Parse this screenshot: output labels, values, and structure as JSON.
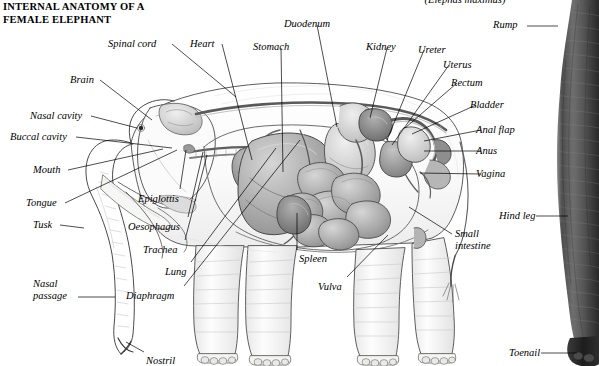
{
  "header": {
    "title": "INTERNAL ANATOMY OF A\nFEMALE ELEPHANT",
    "scientific_name": "(Elephas maximus)"
  },
  "colors": {
    "background": "#ffffff",
    "ink": "#000000",
    "organ_dark": "#6e6e6e",
    "organ_mid": "#9a9a9a",
    "organ_light": "#c9c9c9",
    "body_line": "#4a4a4a",
    "body_fill": "#fbfbfb",
    "photo_dark": "#2b2b2b",
    "photo_mid": "#6a6a6a"
  },
  "figure": {
    "type": "anatomical-illustration",
    "panels": [
      {
        "name": "illustration-panel",
        "description": "pen-and-ink lateral cutaway of a female elephant with internal organs"
      },
      {
        "name": "photo-panel",
        "description": "black-and-white photograph strip of a real elephant hind leg at right edge"
      }
    ]
  },
  "labels": [
    {
      "id": "spinal-cord",
      "text": "Spinal cord",
      "x": 108,
      "y": 38,
      "align": "left",
      "lx": 172,
      "ly": 44,
      "tx": 236,
      "ty": 97
    },
    {
      "id": "heart",
      "text": "Heart",
      "x": 190,
      "y": 38,
      "align": "left",
      "lx": 222,
      "ly": 44,
      "tx": 252,
      "ty": 160
    },
    {
      "id": "stomach",
      "text": "Stomach",
      "x": 253,
      "y": 41,
      "align": "left",
      "lx": 281,
      "ly": 48,
      "tx": 283,
      "ty": 172
    },
    {
      "id": "duodenum",
      "text": "Duodenum",
      "x": 284,
      "y": 18,
      "align": "left",
      "lx": 317,
      "ly": 25,
      "tx": 337,
      "ty": 127
    },
    {
      "id": "kidney",
      "text": "Kidney",
      "x": 366,
      "y": 41,
      "align": "left",
      "lx": 387,
      "ly": 48,
      "tx": 370,
      "ty": 118
    },
    {
      "id": "ureter",
      "text": "Ureter",
      "x": 418,
      "y": 44,
      "align": "left",
      "lx": 424,
      "ly": 50,
      "tx": 387,
      "ty": 140
    },
    {
      "id": "uterus",
      "text": "Uterus",
      "x": 443,
      "y": 59,
      "align": "left",
      "lx": 449,
      "ly": 65,
      "tx": 392,
      "ty": 145
    },
    {
      "id": "rectum",
      "text": "Rectum",
      "x": 451,
      "y": 77,
      "align": "left",
      "lx": 457,
      "ly": 83,
      "tx": 405,
      "ty": 128
    },
    {
      "id": "bladder",
      "text": "Bladder",
      "x": 470,
      "y": 99,
      "align": "left",
      "lx": 476,
      "ly": 105,
      "tx": 412,
      "ty": 134
    },
    {
      "id": "anal-flap",
      "text": "Anal flap",
      "x": 476,
      "y": 124,
      "align": "left",
      "lx": 481,
      "ly": 130,
      "tx": 424,
      "ty": 141
    },
    {
      "id": "anus",
      "text": "Anus",
      "x": 476,
      "y": 145,
      "align": "left",
      "lx": 481,
      "ly": 151,
      "tx": 424,
      "ty": 151
    },
    {
      "id": "vagina",
      "text": "Vagina",
      "x": 476,
      "y": 168,
      "align": "left",
      "lx": 481,
      "ly": 174,
      "tx": 420,
      "ty": 173
    },
    {
      "id": "rump",
      "text": "Rump",
      "x": 493,
      "y": 19,
      "align": "left",
      "lx": 527,
      "ly": 26,
      "tx": 558,
      "ty": 26
    },
    {
      "id": "hind-leg",
      "text": "Hind leg",
      "x": 499,
      "y": 210,
      "align": "left",
      "lx": 536,
      "ly": 216,
      "tx": 568,
      "ty": 216
    },
    {
      "id": "toenail",
      "text": "Toenail",
      "x": 509,
      "y": 347,
      "align": "left",
      "lx": 541,
      "ly": 353,
      "tx": 577,
      "ty": 353
    },
    {
      "id": "small-intestine",
      "text": "Small\nintestine",
      "x": 455,
      "y": 228,
      "align": "left",
      "lx": 452,
      "ly": 234,
      "tx": 409,
      "ty": 207
    },
    {
      "id": "brain",
      "text": "Brain",
      "x": 70,
      "y": 74,
      "align": "left",
      "lx": 100,
      "ly": 80,
      "tx": 152,
      "ty": 120
    },
    {
      "id": "nasal-cavity",
      "text": "Nasal cavity",
      "x": 30,
      "y": 110,
      "align": "left",
      "lx": 91,
      "ly": 116,
      "tx": 137,
      "ty": 128
    },
    {
      "id": "buccal-cavity",
      "text": "Buccal cavity",
      "x": 10,
      "y": 131,
      "align": "left",
      "lx": 76,
      "ly": 137,
      "tx": 172,
      "ty": 148
    },
    {
      "id": "mouth",
      "text": "Mouth",
      "x": 33,
      "y": 164,
      "align": "left",
      "lx": 68,
      "ly": 170,
      "tx": 163,
      "ty": 149
    },
    {
      "id": "tongue",
      "text": "Tongue",
      "x": 26,
      "y": 197,
      "align": "left",
      "lx": 65,
      "ly": 203,
      "tx": 177,
      "ty": 150
    },
    {
      "id": "tusk",
      "text": "Tusk",
      "x": 33,
      "y": 219,
      "align": "left",
      "lx": 60,
      "ly": 225,
      "tx": 84,
      "ty": 228
    },
    {
      "id": "nasal-passage",
      "text": "Nasal\npassage",
      "x": 33,
      "y": 278,
      "align": "left",
      "lx": 78,
      "ly": 297,
      "tx": 115,
      "ty": 297
    },
    {
      "id": "epiglottis",
      "text": "Epiglottis",
      "x": 138,
      "y": 193,
      "align": "left",
      "lx": 180,
      "ly": 189,
      "tx": 186,
      "ty": 150
    },
    {
      "id": "oesophagus",
      "text": "Oesophagus",
      "x": 128,
      "y": 221,
      "align": "left",
      "lx": 188,
      "ly": 217,
      "tx": 203,
      "ty": 152
    },
    {
      "id": "trachea",
      "text": "Trachea",
      "x": 143,
      "y": 244,
      "align": "left",
      "lx": 185,
      "ly": 240,
      "tx": 207,
      "ty": 155
    },
    {
      "id": "lung",
      "text": "Lung",
      "x": 165,
      "y": 266,
      "align": "left",
      "lx": 191,
      "ly": 262,
      "tx": 276,
      "ty": 148
    },
    {
      "id": "diaphragm",
      "text": "Diaphragm",
      "x": 126,
      "y": 290,
      "align": "left",
      "lx": 184,
      "ly": 286,
      "tx": 300,
      "ty": 140
    },
    {
      "id": "spleen",
      "text": "Spleen",
      "x": 299,
      "y": 253,
      "align": "left",
      "lx": 297,
      "ly": 250,
      "tx": 297,
      "ty": 213
    },
    {
      "id": "vulva",
      "text": "Vulva",
      "x": 318,
      "y": 281,
      "align": "left",
      "lx": 347,
      "ly": 277,
      "tx": 388,
      "ty": 235
    },
    {
      "id": "nostril",
      "text": "Nostril",
      "x": 146,
      "y": 355,
      "align": "left",
      "lx": 144,
      "ly": 352,
      "tx": 126,
      "ty": 342
    }
  ]
}
